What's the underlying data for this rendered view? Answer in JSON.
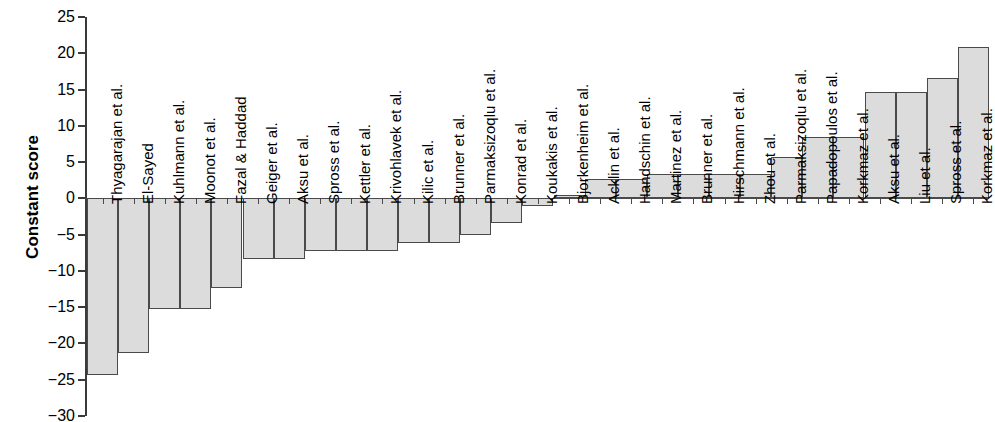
{
  "chart_data": {
    "type": "bar",
    "title": "",
    "xlabel": "",
    "ylabel": "Constant score",
    "ylim": [
      -30,
      25
    ],
    "ytick_labels": [
      "25",
      "20",
      "15",
      "10",
      "5",
      "0",
      "−5",
      "−10",
      "−15",
      "−20",
      "−25",
      "−30"
    ],
    "ytick_values": [
      25,
      20,
      15,
      10,
      5,
      0,
      -5,
      -10,
      -15,
      -20,
      -25,
      -30
    ],
    "grid": false,
    "legend": null,
    "bar_fill_color": "#dcdcdc",
    "bar_edge_color": "#4a4a4a",
    "categories": [
      "Thyagarajan et al.",
      "El-Sayed",
      "Kuhlmann et al.",
      "Moonot et al.",
      "Fazal & Haddad",
      "Geiger et al.",
      "Aksu et al.",
      "Spross et al.",
      "Kettler et al.",
      "Krivohlavek et al.",
      "Kilic et al.",
      "Brunner et al.",
      "Parmaksizoqlu et al.",
      "Konrad et al.",
      "Koukakis et al.",
      "Bjorkenheim et al.",
      "Acklin et al.",
      "Handschin et al.",
      "Martinez et al.",
      "Brunner et al.",
      "Hirschmann et al.",
      "Zhou et al.",
      "Parmaksizoqlu et al.",
      "Papadopoulos et al.",
      "Korkmaz et al.",
      "Aksu et al.",
      "Liu et al.",
      "Spross et al.",
      "Korkmaz et al."
    ],
    "values": [
      -24.3,
      -21.3,
      -15.2,
      -15.2,
      -12.3,
      -8.3,
      -8.3,
      -7.2,
      -7.2,
      -7.2,
      -6.2,
      -6.2,
      -5.0,
      -3.4,
      -1.0,
      0.5,
      2.7,
      2.7,
      3.4,
      3.4,
      3.4,
      3.4,
      5.7,
      8.5,
      8.5,
      14.7,
      14.7,
      16.6,
      20.8
    ]
  }
}
